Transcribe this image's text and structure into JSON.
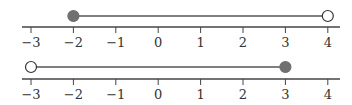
{
  "tick_labels": [
    "−3",
    "−2",
    "−1",
    "0",
    "1",
    "2",
    "3",
    "4"
  ],
  "number_lines": [
    {
      "name": "top",
      "segment": {
        "from": -2,
        "to": 4
      },
      "left_endpoint": {
        "value": -2,
        "type": "closed"
      },
      "right_endpoint": {
        "value": 4,
        "type": "open"
      }
    },
    {
      "name": "bottom",
      "segment": {
        "from": -3,
        "to": 3
      },
      "left_endpoint": {
        "value": -3,
        "type": "open"
      },
      "right_endpoint": {
        "value": 3,
        "type": "closed"
      }
    }
  ],
  "colors": {
    "axis": "#444444",
    "filled_point": "#707070",
    "segment": "#555555"
  }
}
